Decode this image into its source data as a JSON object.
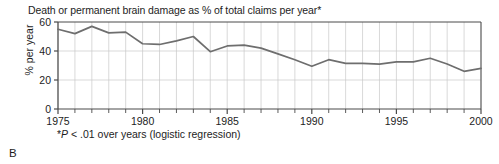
{
  "chart_data": {
    "type": "line",
    "title": "Death or permanent brain damage as % of total claims per year*",
    "xlabel": "",
    "ylabel": "% per year",
    "footnote_prefix": "*",
    "footnote_italic": "P",
    "footnote_rest": " < .01 over years (logistic regression)",
    "footnote_full": "*P < .01 over years (logistic regression)",
    "panel_letter": "B",
    "xlim": [
      1975,
      2000
    ],
    "ylim": [
      0,
      60
    ],
    "x_major_ticks": [
      1975,
      1980,
      1985,
      1990,
      1995,
      2000
    ],
    "x_tick_labels": [
      "1975",
      "1980",
      "1985",
      "1990",
      "1995",
      "2000"
    ],
    "x_minor_tick_step": 1,
    "y_ticks": [
      0,
      20,
      40,
      60
    ],
    "y_tick_labels": [
      "0",
      "20",
      "40",
      "60"
    ],
    "grid": "vertical yearly gridlines plus horizontal lines at 20, 40 and 60",
    "legend": "none",
    "line_color": "#6e6e6e",
    "grid_color": "#c8c8c8",
    "axis_color": "#4a4a4a",
    "x": [
      1975,
      1976,
      1977,
      1978,
      1979,
      1980,
      1981,
      1982,
      1983,
      1984,
      1985,
      1986,
      1987,
      1988,
      1989,
      1990,
      1991,
      1992,
      1993,
      1994,
      1995,
      1996,
      1997,
      1998,
      1999,
      2000
    ],
    "values": [
      55,
      52,
      57,
      52.5,
      53,
      45,
      44.5,
      47,
      50,
      39.5,
      43.5,
      44,
      42,
      38,
      34,
      29.5,
      34,
      31.5,
      31.5,
      31,
      32.5,
      32.5,
      35,
      31,
      26,
      28
    ]
  }
}
